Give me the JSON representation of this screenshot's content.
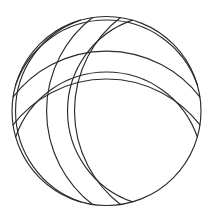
{
  "figure": {
    "background_color": "#ffffff",
    "stroke_color": "#2b2b2b",
    "stroke_width": 1.15,
    "canvas": {
      "width": 212,
      "height": 220
    }
  },
  "geometry": {
    "center": {
      "x": 106.5,
      "y": 111.0
    },
    "outer_circle": {
      "name": "outer-circle",
      "cx": 106.5,
      "cy": 111.0,
      "r": 94.5
    },
    "arc_radius_outer": 118.0,
    "arc_radius_inner": 96.0,
    "arc_offset_outer": 86.0,
    "arc_offset_inner": 57.0,
    "directions": [
      {
        "name": "top",
        "angle_deg": -90
      },
      {
        "name": "right",
        "angle_deg": 0
      },
      {
        "name": "bottom",
        "angle_deg": 90
      },
      {
        "name": "left",
        "angle_deg": 180
      }
    ],
    "arc_count_total": 9,
    "symmetry": "4-fold rotational (D4)"
  },
  "paths": {
    "outer_circle": "M 106.5 16.5 A 94.5 94.5 0 1 1 106.45 16.5 Z",
    "arcs": [
      {
        "name": "arc-top-outer",
        "d": "M 21.3 70.3 A 118 118 0 0 0 191.7 70.3"
      },
      {
        "name": "arc-top-inner",
        "d": "M 33.6 41.6 A 96 96 0 0 0 179.4 41.6"
      },
      {
        "name": "arc-bottom-outer",
        "d": "M 21.3 151.7 A 118 118 0 0 1 191.7 151.7"
      },
      {
        "name": "arc-bottom-inner",
        "d": "M 33.6 180.4 A 96 96 0 0 1 179.4 180.4"
      },
      {
        "name": "arc-left-outer",
        "d": "M 65.8 25.8 A 118 118 0 0 0 65.8 196.2"
      },
      {
        "name": "arc-left-inner",
        "d": "M 37.1 38.1 A 96 96 0 0 0 37.1 183.9"
      },
      {
        "name": "arc-right-outer",
        "d": "M 147.2 25.8 A 118 118 0 0 1 147.2 196.2"
      },
      {
        "name": "arc-right-inner",
        "d": "M 175.9 38.1 A 96 96 0 0 1 175.9 183.9"
      }
    ]
  }
}
